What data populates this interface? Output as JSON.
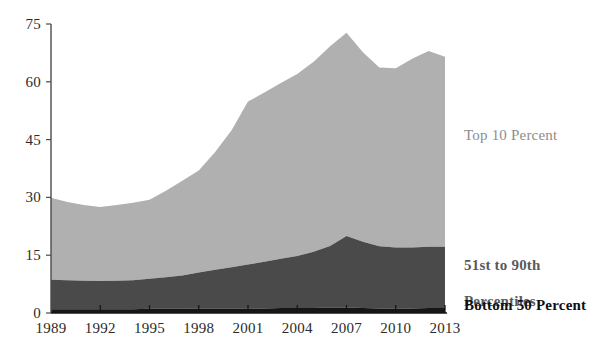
{
  "chart_data": {
    "type": "area",
    "stacked": true,
    "title": "",
    "subtitle": "",
    "xlabel": "",
    "ylabel": "",
    "x": [
      1989,
      1990,
      1991,
      1992,
      1993,
      1994,
      1995,
      1996,
      1997,
      1998,
      1999,
      2000,
      2001,
      2002,
      2003,
      2004,
      2005,
      2006,
      2007,
      2008,
      2009,
      2010,
      2011,
      2012,
      2013
    ],
    "xlim": [
      1989,
      2013
    ],
    "ylim": [
      0,
      75
    ],
    "yticks": [
      0,
      15,
      30,
      45,
      60,
      75
    ],
    "xticks": [
      1989,
      1992,
      1995,
      1998,
      2001,
      2004,
      2007,
      2010,
      2013
    ],
    "grid": false,
    "legend_position": "right-inline-annotations",
    "series": [
      {
        "name": "Bottom 50 Percent",
        "color": "#161616",
        "label_color": "#101010",
        "values": [
          1.0,
          1.0,
          1.0,
          1.0,
          1.0,
          1.0,
          1.1,
          1.1,
          1.1,
          1.2,
          1.2,
          1.2,
          1.2,
          1.2,
          1.3,
          1.3,
          1.3,
          1.4,
          1.4,
          1.3,
          1.2,
          1.2,
          1.2,
          1.3,
          1.3
        ]
      },
      {
        "name": "51st to 90th Percentiles",
        "color": "#4a4a4a",
        "label_color": "#5a5a5a",
        "values": [
          7.6,
          7.5,
          7.4,
          7.3,
          7.4,
          7.5,
          7.8,
          8.2,
          8.6,
          9.3,
          10.0,
          10.7,
          11.4,
          12.1,
          12.8,
          13.5,
          14.6,
          16.0,
          18.6,
          17.2,
          16.1,
          15.8,
          15.8,
          15.9,
          15.9
        ]
      },
      {
        "name": "Top 10 Percent",
        "color": "#b0b0b0",
        "label_color": "#8d8d8d",
        "values": [
          21.3,
          20.3,
          19.6,
          19.2,
          19.6,
          20.1,
          20.5,
          22.4,
          24.6,
          26.5,
          30.6,
          35.5,
          42.3,
          43.9,
          45.6,
          47.2,
          49.3,
          51.8,
          52.7,
          49.2,
          46.4,
          46.5,
          49.0,
          50.8,
          49.3
        ]
      }
    ],
    "stack_tops": {
      "bottom_50": [
        1.0,
        1.0,
        1.0,
        1.0,
        1.0,
        1.0,
        1.1,
        1.1,
        1.1,
        1.2,
        1.2,
        1.2,
        1.2,
        1.2,
        1.3,
        1.3,
        1.3,
        1.4,
        1.4,
        1.3,
        1.2,
        1.2,
        1.2,
        1.3,
        1.3
      ],
      "through_90th": [
        8.6,
        8.5,
        8.4,
        8.3,
        8.4,
        8.5,
        8.9,
        9.3,
        9.7,
        10.5,
        11.2,
        11.9,
        12.6,
        13.3,
        14.1,
        14.8,
        15.9,
        17.4,
        20.0,
        18.5,
        17.3,
        17.0,
        17.0,
        17.2,
        17.2
      ],
      "total": [
        29.9,
        28.8,
        28.0,
        27.5,
        28.0,
        28.6,
        29.4,
        31.7,
        34.3,
        37.0,
        41.8,
        47.4,
        54.9,
        57.2,
        59.7,
        62.0,
        65.2,
        69.2,
        72.7,
        67.7,
        63.7,
        63.5,
        66.0,
        68.0,
        66.5
      ]
    },
    "annotations": [
      {
        "text": "Top 10 Percent",
        "series": "Top 10 Percent"
      },
      {
        "text": "51st to 90th\nPercentiles",
        "series": "51st to 90th Percentiles"
      },
      {
        "text": "Bottom 50 Percent",
        "series": "Bottom 50 Percent"
      }
    ]
  },
  "axes": {
    "y_tick_labels": [
      "75",
      "60",
      "45",
      "30",
      "15",
      "0"
    ],
    "x_tick_labels": [
      "1989",
      "1992",
      "1995",
      "1998",
      "2001",
      "2004",
      "2007",
      "2010",
      "2013"
    ]
  },
  "labels": {
    "top10": "Top 10 Percent",
    "mid_line1": "51st to 90th",
    "mid_line2": "Percentiles",
    "bottom50": "Bottom 50 Percent"
  },
  "colors": {
    "top10": "#b0b0b0",
    "mid": "#4a4a4a",
    "bottom50": "#161616",
    "axis": "#4b4b4b",
    "text": "#2b2b2b",
    "background": "#ffffff"
  }
}
